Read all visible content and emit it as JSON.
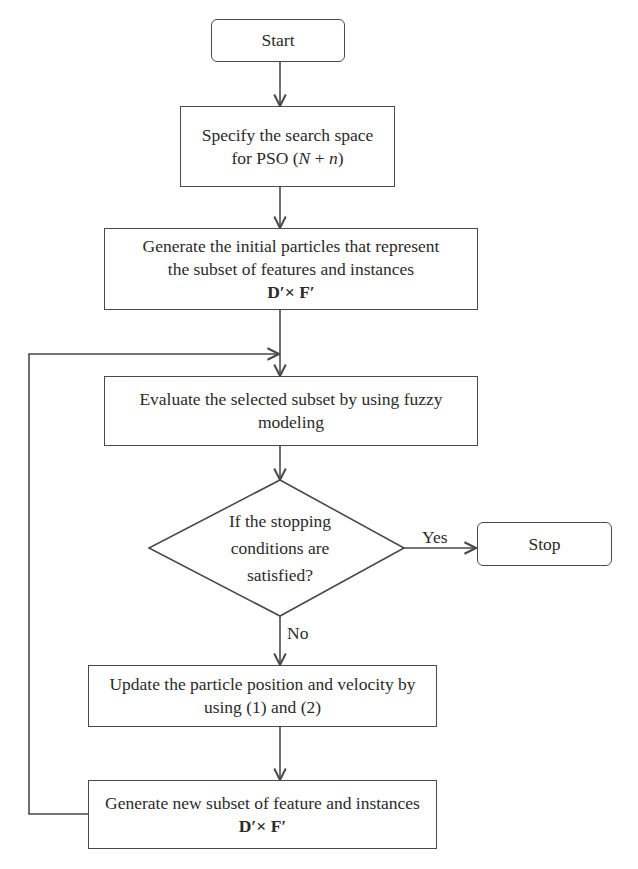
{
  "flowchart": {
    "start": {
      "label": "Start"
    },
    "specify": {
      "line1": "Specify the search space",
      "line2_prefix": "for PSO (",
      "line2_N": "N",
      "line2_plus": " + ",
      "line2_n": "n",
      "line2_suffix": ")"
    },
    "init_particles": {
      "line1": "Generate the initial particles that represent",
      "line2": "the subset of features and instances",
      "formula": "D′× F′"
    },
    "evaluate": {
      "line1": "Evaluate the selected subset by using fuzzy",
      "line2": "modeling"
    },
    "decision": {
      "line1": "If the stopping",
      "line2": "conditions are",
      "line3": "satisfied?"
    },
    "yes_label": "Yes",
    "no_label": "No",
    "stop": {
      "label": "Stop"
    },
    "update": {
      "line1": "Update the particle position and velocity by",
      "line2": "using (1) and (2)"
    },
    "generate_new": {
      "line1": "Generate new subset of feature and instances",
      "formula": "D′× F′"
    },
    "colors": {
      "line": "#4a4a4a",
      "text": "#2b2b2b",
      "background": "#ffffff"
    }
  }
}
